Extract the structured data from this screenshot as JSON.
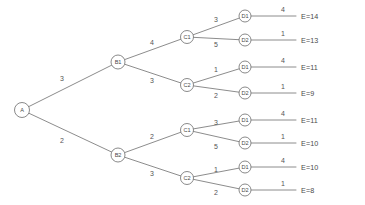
{
  "diagram": {
    "type": "decision-tree",
    "title": "",
    "root": {
      "id": "A",
      "label": "A",
      "x": 22,
      "y": 110,
      "r": 7.5
    },
    "nodes": [
      {
        "id": "B1",
        "label": "B1",
        "x": 118,
        "y": 62,
        "r": 7
      },
      {
        "id": "B2",
        "label": "B2",
        "x": 118,
        "y": 155,
        "r": 7
      },
      {
        "id": "C1a",
        "label": "C1",
        "x": 187,
        "y": 37,
        "r": 6.5
      },
      {
        "id": "C2a",
        "label": "C2",
        "x": 187,
        "y": 85,
        "r": 6.5
      },
      {
        "id": "C1b",
        "label": "C1",
        "x": 187,
        "y": 130,
        "r": 6.5
      },
      {
        "id": "C2b",
        "label": "C2",
        "x": 187,
        "y": 178,
        "r": 6.5
      },
      {
        "id": "D1a",
        "label": "D1",
        "x": 245,
        "y": 16,
        "r": 6
      },
      {
        "id": "D2a",
        "label": "D2",
        "x": 245,
        "y": 40,
        "r": 6
      },
      {
        "id": "D1b",
        "label": "D1",
        "x": 245,
        "y": 67,
        "r": 6
      },
      {
        "id": "D2b",
        "label": "D2",
        "x": 245,
        "y": 93,
        "r": 6
      },
      {
        "id": "D1c",
        "label": "D1",
        "x": 245,
        "y": 120,
        "r": 6
      },
      {
        "id": "D2c",
        "label": "D2",
        "x": 245,
        "y": 143,
        "r": 6
      },
      {
        "id": "D1d",
        "label": "D1",
        "x": 245,
        "y": 167,
        "r": 6
      },
      {
        "id": "D2d",
        "label": "D2",
        "x": 245,
        "y": 190,
        "r": 6
      }
    ],
    "edges": [
      {
        "from": "A",
        "to": "B1",
        "weight": "3",
        "lx": 62,
        "ly": 78
      },
      {
        "from": "A",
        "to": "B2",
        "weight": "2",
        "lx": 62,
        "ly": 140
      },
      {
        "from": "B1",
        "to": "C1a",
        "weight": "4",
        "lx": 152,
        "ly": 42
      },
      {
        "from": "B1",
        "to": "C2a",
        "weight": "3",
        "lx": 152,
        "ly": 80
      },
      {
        "from": "B2",
        "to": "C1b",
        "weight": "2",
        "lx": 152,
        "ly": 136
      },
      {
        "from": "B2",
        "to": "C2b",
        "weight": "3",
        "lx": 152,
        "ly": 173
      },
      {
        "from": "C1a",
        "to": "D1a",
        "weight": "3",
        "lx": 216,
        "ly": 19
      },
      {
        "from": "C1a",
        "to": "D2a",
        "weight": "5",
        "lx": 216,
        "ly": 44
      },
      {
        "from": "C2a",
        "to": "D1b",
        "weight": "1",
        "lx": 216,
        "ly": 69
      },
      {
        "from": "C2a",
        "to": "D2b",
        "weight": "2",
        "lx": 216,
        "ly": 95
      },
      {
        "from": "C1b",
        "to": "D1c",
        "weight": "3",
        "lx": 216,
        "ly": 122
      },
      {
        "from": "C1b",
        "to": "D2c",
        "weight": "5",
        "lx": 216,
        "ly": 146
      },
      {
        "from": "C2b",
        "to": "D1d",
        "weight": "1",
        "lx": 216,
        "ly": 169
      },
      {
        "from": "C2b",
        "to": "D2d",
        "weight": "2",
        "lx": 216,
        "ly": 192
      }
    ],
    "terminals": [
      {
        "from": "D1a",
        "weight": "4",
        "wx": 283,
        "wy": 9,
        "payoff": "E=14",
        "px": 301,
        "py": 16
      },
      {
        "from": "D2a",
        "weight": "1",
        "wx": 283,
        "wy": 33,
        "payoff": "E=13",
        "px": 301,
        "py": 40
      },
      {
        "from": "D1b",
        "weight": "4",
        "wx": 283,
        "wy": 60,
        "payoff": "E=11",
        "px": 301,
        "py": 67
      },
      {
        "from": "D2b",
        "weight": "1",
        "wx": 283,
        "wy": 86,
        "payoff": "E=9",
        "px": 301,
        "py": 93
      },
      {
        "from": "D1c",
        "weight": "4",
        "wx": 283,
        "wy": 113,
        "payoff": "E=11",
        "px": 301,
        "py": 120
      },
      {
        "from": "D2c",
        "weight": "1",
        "wx": 283,
        "wy": 136,
        "payoff": "E=10",
        "px": 301,
        "py": 143
      },
      {
        "from": "D1d",
        "weight": "4",
        "wx": 283,
        "wy": 160,
        "payoff": "E=10",
        "px": 301,
        "py": 167
      },
      {
        "from": "D2d",
        "weight": "1",
        "wx": 283,
        "wy": 183,
        "payoff": "E=8",
        "px": 301,
        "py": 190
      }
    ],
    "terminal_line_end_x": 296,
    "colors": {
      "background": "#ffffff",
      "stroke": "#6e6e6e",
      "text": "#4a4a4a"
    }
  }
}
